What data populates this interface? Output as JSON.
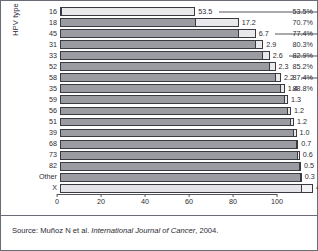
{
  "axis_title_y": "HPV type",
  "source": {
    "prefix": "Source: Muñoz N et al. ",
    "journal": "International Journal of Cancer",
    "suffix": ", 2004."
  },
  "xaxis": {
    "ticks": [
      "0",
      "20",
      "40",
      "60",
      "80",
      "100"
    ]
  },
  "chart_data": {
    "type": "bar",
    "orientation": "horizontal",
    "subtype": "cumulative-stacked",
    "title": "",
    "xlabel": "",
    "ylabel": "HPV type",
    "xlim": [
      0,
      100
    ],
    "xticks": [
      0,
      20,
      40,
      60,
      80,
      100
    ],
    "grid": false,
    "legend": "none",
    "categories": [
      "16",
      "18",
      "45",
      "31",
      "33",
      "52",
      "58",
      "35",
      "59",
      "56",
      "51",
      "39",
      "68",
      "73",
      "82",
      "Other",
      "X"
    ],
    "values": [
      53.5,
      17.2,
      6.7,
      2.9,
      2.6,
      2.3,
      2.2,
      1.4,
      1.3,
      1.2,
      1.2,
      1.0,
      0.7,
      0.6,
      0.5,
      0.3,
      4.4
    ],
    "cumulative": [
      53.5,
      70.7,
      77.4,
      80.3,
      82.9,
      85.2,
      87.4,
      88.8,
      90.1,
      91.3,
      92.5,
      93.5,
      94.2,
      94.8,
      95.3,
      95.6,
      100.0
    ],
    "value_labels": [
      "53.5",
      "17.2",
      "6.7",
      "2.9",
      "2.6",
      "2.3",
      "2.2",
      "1.4",
      "1.3",
      "1.2",
      "1.2",
      "1.0",
      "0.7",
      "0.6",
      "0.5",
      "0.3",
      "4.4"
    ],
    "cumulative_labels": [
      "53.5%",
      "70.7%",
      "77.4%",
      "80.3%",
      "82.9%",
      "85.2%",
      "87.4%",
      "88.8%",
      "",
      "",
      "",
      "",
      "",
      "",
      "",
      "",
      ""
    ],
    "leader_line_rows": [
      0,
      2,
      4,
      6
    ],
    "colors": {
      "bar_cumulative_fill": "#9b9ba2",
      "bar_increment_fill": "#e9e9ec",
      "bar_outline": "#3a3a42",
      "axis": "#54545e",
      "text": "#2b2b33",
      "frame": "#6b6b78",
      "background": "#ffffff"
    }
  },
  "rows": [
    {
      "label": "16",
      "value": "53.5",
      "cum": "53.5%",
      "pct_total": 53.5,
      "pct_cum": 53.5,
      "leader": true
    },
    {
      "label": "18",
      "value": "17.2",
      "cum": "70.7%",
      "pct_total": 17.2,
      "pct_cum": 70.7,
      "leader": false
    },
    {
      "label": "45",
      "value": "6.7",
      "cum": "77.4%",
      "pct_total": 6.7,
      "pct_cum": 77.4,
      "leader": true
    },
    {
      "label": "31",
      "value": "2.9",
      "cum": "80.3%",
      "pct_total": 2.9,
      "pct_cum": 80.3,
      "leader": false
    },
    {
      "label": "33",
      "value": "2.6",
      "cum": "82.9%",
      "pct_total": 2.6,
      "pct_cum": 82.9,
      "leader": true
    },
    {
      "label": "52",
      "value": "2.3",
      "cum": "85.2%",
      "pct_total": 2.3,
      "pct_cum": 85.2,
      "leader": false
    },
    {
      "label": "58",
      "value": "2.2",
      "cum": "87.4%",
      "pct_total": 2.2,
      "pct_cum": 87.4,
      "leader": true
    },
    {
      "label": "35",
      "value": "1.4",
      "cum": "88.8%",
      "pct_total": 1.4,
      "pct_cum": 88.8,
      "leader": false
    },
    {
      "label": "59",
      "value": "1.3",
      "cum": "",
      "pct_total": 1.3,
      "pct_cum": 90.1,
      "leader": false
    },
    {
      "label": "56",
      "value": "1.2",
      "cum": "",
      "pct_total": 1.2,
      "pct_cum": 91.3,
      "leader": false
    },
    {
      "label": "51",
      "value": "1.2",
      "cum": "",
      "pct_total": 1.2,
      "pct_cum": 92.5,
      "leader": false
    },
    {
      "label": "39",
      "value": "1.0",
      "cum": "",
      "pct_total": 1.0,
      "pct_cum": 93.5,
      "leader": false
    },
    {
      "label": "68",
      "value": "0.7",
      "cum": "",
      "pct_total": 0.7,
      "pct_cum": 94.2,
      "leader": false
    },
    {
      "label": "73",
      "value": "0.6",
      "cum": "",
      "pct_total": 0.6,
      "pct_cum": 94.8,
      "leader": false
    },
    {
      "label": "82",
      "value": "0.5",
      "cum": "",
      "pct_total": 0.5,
      "pct_cum": 95.3,
      "leader": false
    },
    {
      "label": "Other",
      "value": "0.3",
      "cum": "",
      "pct_total": 0.3,
      "pct_cum": 95.6,
      "leader": false
    },
    {
      "label": "X",
      "value": "4.4",
      "cum": "",
      "pct_total": 4.4,
      "pct_cum": 100.0,
      "leader": false,
      "pale": true
    }
  ]
}
